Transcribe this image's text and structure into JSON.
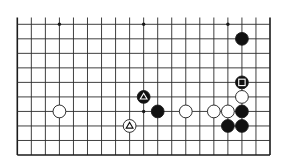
{
  "diagram": {
    "type": "go-board-partial",
    "columns": 19,
    "rows_shown": 10,
    "top_edge_open": true,
    "colors": {
      "line": "#2a2a2a",
      "border": "#1a1a1a",
      "black_stone": "#111111",
      "white_stone": "#ffffff",
      "background": "#ffffff"
    },
    "star_points": [
      {
        "col": 3,
        "row": 0
      },
      {
        "col": 9,
        "row": 0
      },
      {
        "col": 15,
        "row": 0
      },
      {
        "col": 9,
        "row": 6
      }
    ],
    "stones": [
      {
        "color": "black",
        "col": 16,
        "row": 1,
        "mark": ""
      },
      {
        "color": "black",
        "col": 16,
        "row": 4,
        "mark": "square"
      },
      {
        "color": "white",
        "col": 16,
        "row": 5,
        "mark": ""
      },
      {
        "color": "black",
        "col": 9,
        "row": 5,
        "mark": "triangle"
      },
      {
        "color": "white",
        "col": 3,
        "row": 6,
        "mark": ""
      },
      {
        "color": "black",
        "col": 10,
        "row": 6,
        "mark": ""
      },
      {
        "color": "white",
        "col": 12,
        "row": 6,
        "mark": ""
      },
      {
        "color": "white",
        "col": 14,
        "row": 6,
        "mark": ""
      },
      {
        "color": "white",
        "col": 15,
        "row": 6,
        "mark": ""
      },
      {
        "color": "black",
        "col": 16,
        "row": 6,
        "mark": ""
      },
      {
        "color": "white",
        "col": 8,
        "row": 7,
        "mark": "triangle"
      },
      {
        "color": "black",
        "col": 15,
        "row": 7,
        "mark": ""
      },
      {
        "color": "black",
        "col": 16,
        "row": 7,
        "mark": ""
      }
    ]
  }
}
